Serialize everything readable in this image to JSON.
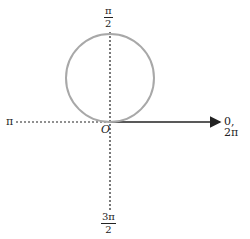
{
  "diagram": {
    "type": "polar-graph",
    "colors": {
      "circle": "#a8a8a8",
      "axis": "#222222",
      "polar_axis": "#222222",
      "text": "#222222"
    },
    "labels": {
      "top": {
        "num": "π",
        "den": "2"
      },
      "bottom": {
        "num": "3π",
        "den": "2"
      },
      "left": "π",
      "right": "0, 2π",
      "origin": "O"
    },
    "circle": {
      "center_x": 110,
      "center_y": 78,
      "radius": 44
    },
    "origin_px": {
      "x": 110,
      "y": 122
    }
  }
}
